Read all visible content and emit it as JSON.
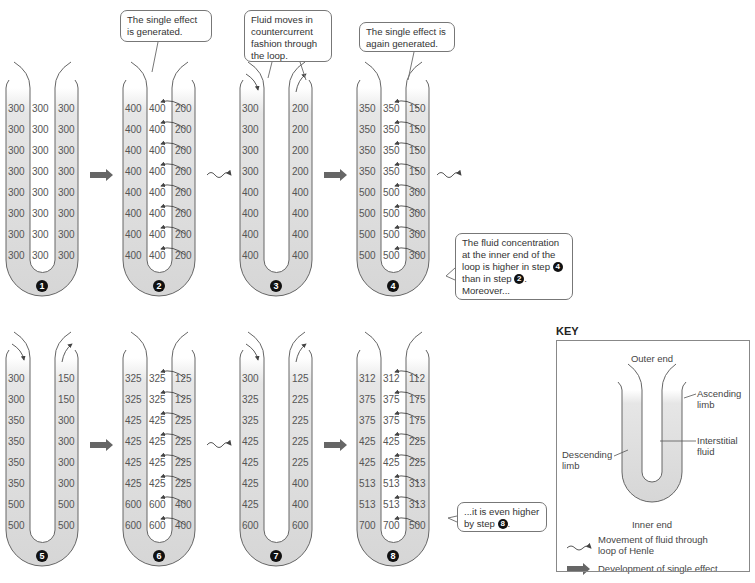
{
  "colors": {
    "tube_fill": "#d8d8d8",
    "wall": "#666666",
    "arrow": "#666666",
    "text": "#555555"
  },
  "header": {
    "cut_off_text": "(b) Development of concentration gradient by the countercurrent multiplier"
  },
  "bubbles": {
    "step2": "The single effect is generated.",
    "step3": "Fluid moves in countercurrent fashion through the loop.",
    "step4": "The single effect is again generated.",
    "step4_note_a": "The fluid concentration at the inner end of the loop is higher in step",
    "step4_note_num1": "4",
    "step4_note_b": "than in step",
    "step4_note_num2": "2",
    "step4_note_c": ". Moreover...",
    "step8_note_a": "...it is even higher by step",
    "step8_note_num": "8",
    "step8_note_b": "."
  },
  "steps": [
    {
      "label": "1",
      "desc": [
        "300",
        "300",
        "300",
        "300",
        "300",
        "300",
        "300",
        "300"
      ],
      "inter": [
        "300",
        "300",
        "300",
        "300",
        "300",
        "300",
        "300",
        "300"
      ],
      "asc": [
        "300",
        "300",
        "300",
        "300",
        "300",
        "300",
        "300",
        "300"
      ],
      "pump": false,
      "flow": false
    },
    {
      "label": "2",
      "desc": [
        "400",
        "400",
        "400",
        "400",
        "400",
        "400",
        "400",
        "400"
      ],
      "inter": [
        "400",
        "400",
        "400",
        "400",
        "400",
        "400",
        "400",
        "400"
      ],
      "asc": [
        "200",
        "200",
        "200",
        "200",
        "200",
        "200",
        "200",
        "200"
      ],
      "pump": true,
      "flow": false
    },
    {
      "label": "3",
      "desc": [
        "300",
        "300",
        "300",
        "300",
        "400",
        "400",
        "400",
        "400"
      ],
      "inter": [],
      "asc": [
        "200",
        "200",
        "200",
        "200",
        "400",
        "400",
        "400",
        "400"
      ],
      "pump": false,
      "flow": true
    },
    {
      "label": "4",
      "desc": [
        "350",
        "350",
        "350",
        "350",
        "500",
        "500",
        "500",
        "500"
      ],
      "inter": [
        "350",
        "350",
        "350",
        "350",
        "500",
        "500",
        "500",
        "500"
      ],
      "asc": [
        "150",
        "150",
        "150",
        "150",
        "300",
        "300",
        "300",
        "300"
      ],
      "pump": true,
      "flow": false
    },
    {
      "label": "5",
      "desc": [
        "300",
        "300",
        "350",
        "350",
        "350",
        "350",
        "500",
        "500"
      ],
      "inter": [],
      "asc": [
        "150",
        "150",
        "300",
        "300",
        "300",
        "300",
        "500",
        "500"
      ],
      "pump": false,
      "flow": true
    },
    {
      "label": "6",
      "desc": [
        "325",
        "325",
        "425",
        "425",
        "425",
        "425",
        "600",
        "600"
      ],
      "inter": [
        "325",
        "325",
        "425",
        "425",
        "425",
        "425",
        "600",
        "600"
      ],
      "asc": [
        "125",
        "125",
        "225",
        "225",
        "225",
        "225",
        "400",
        "400"
      ],
      "pump": true,
      "flow": false
    },
    {
      "label": "7",
      "desc": [
        "300",
        "325",
        "325",
        "425",
        "425",
        "425",
        "425",
        "600"
      ],
      "inter": [],
      "asc": [
        "125",
        "225",
        "225",
        "225",
        "225",
        "400",
        "400",
        "600"
      ],
      "pump": false,
      "flow": true
    },
    {
      "label": "8",
      "desc": [
        "312",
        "375",
        "375",
        "425",
        "425",
        "513",
        "513",
        "700"
      ],
      "inter": [
        "312",
        "375",
        "375",
        "425",
        "425",
        "513",
        "513",
        "700"
      ],
      "asc": [
        "112",
        "175",
        "175",
        "225",
        "225",
        "313",
        "313",
        "500"
      ],
      "pump": true,
      "flow": false
    }
  ],
  "transitions": [
    {
      "from": "1",
      "to": "2",
      "type": "single-effect"
    },
    {
      "from": "2",
      "to": "3",
      "type": "fluid-movement"
    },
    {
      "from": "3",
      "to": "4",
      "type": "single-effect"
    },
    {
      "from": "4",
      "to": "5",
      "type": "fluid-movement"
    },
    {
      "from": "5",
      "to": "6",
      "type": "single-effect"
    },
    {
      "from": "6",
      "to": "7",
      "type": "fluid-movement"
    },
    {
      "from": "7",
      "to": "8",
      "type": "single-effect"
    }
  ],
  "key": {
    "title": "KEY",
    "outer_end": "Outer end",
    "inner_end": "Inner end",
    "ascending": "Ascending limb",
    "ascending_l1": "Ascending",
    "ascending_l2": "limb",
    "descending_l1": "Descending",
    "descending_l2": "limb",
    "interstitial_l1": "Interstitial",
    "interstitial_l2": "fluid",
    "legend_flow_l1": "Movement of fluid through",
    "legend_flow_l2": "loop of Henle",
    "legend_effect": "Development of single effect"
  }
}
